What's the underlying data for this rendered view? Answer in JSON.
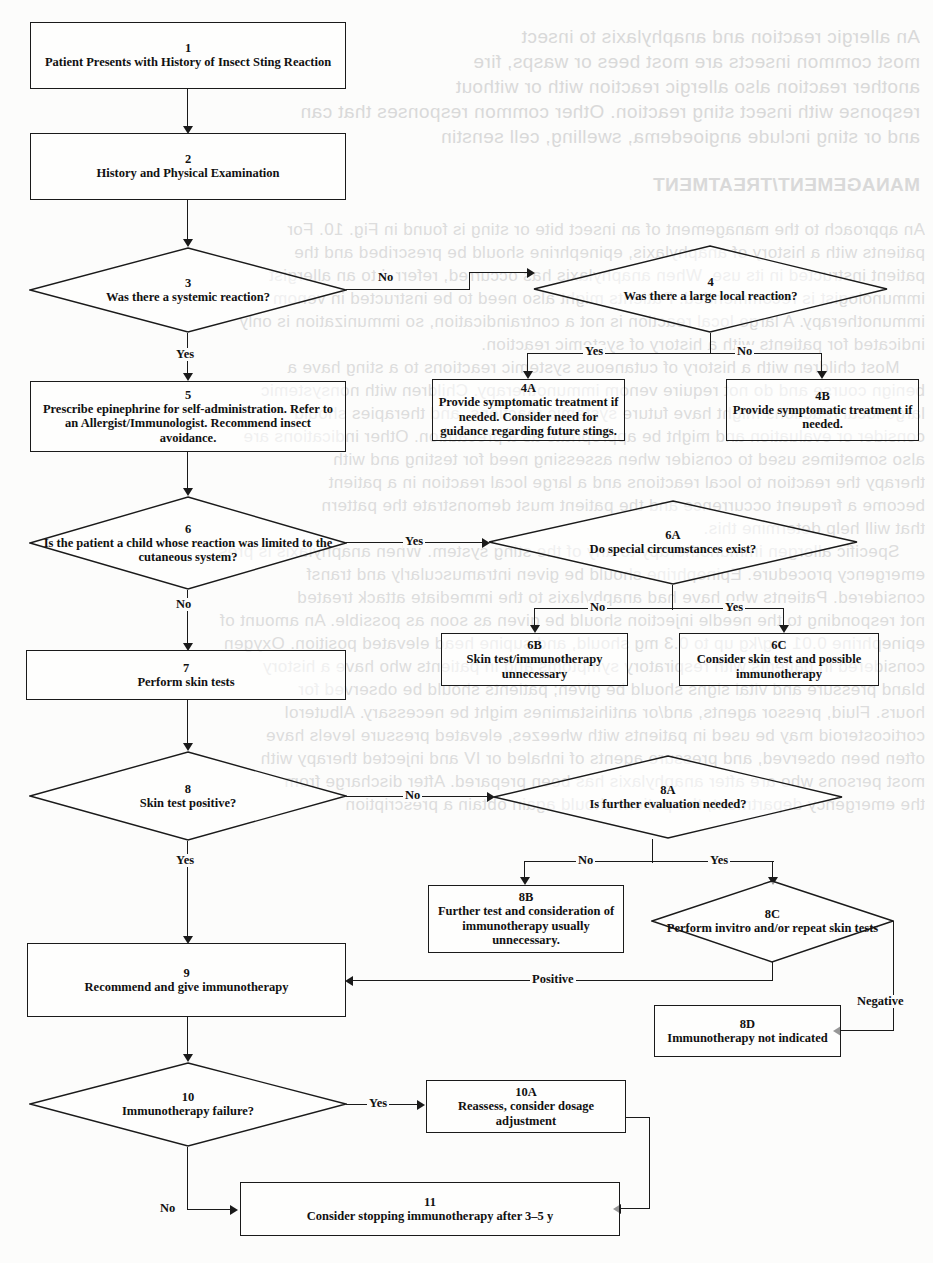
{
  "document": {
    "type": "clinical-algorithm-flowchart",
    "title": "Insect Sting Reaction Management Algorithm"
  },
  "nodes": [
    {
      "id": "n1",
      "number": "1",
      "shape": "box",
      "text": "Patient Presents with History of Insect Sting Reaction"
    },
    {
      "id": "n2",
      "number": "2",
      "shape": "box",
      "text": "History and Physical Examination"
    },
    {
      "id": "n3",
      "number": "3",
      "shape": "diamond",
      "text": "Was there a systemic reaction?"
    },
    {
      "id": "n4",
      "number": "4",
      "shape": "diamond",
      "text": "Was there a large local reaction?"
    },
    {
      "id": "n4a",
      "number": "4A",
      "shape": "box",
      "text": "Provide symptomatic treatment if needed.  Consider need for guidance regarding future stings."
    },
    {
      "id": "n4b",
      "number": "4B",
      "shape": "box",
      "text": "Provide symptomatic treatment if needed."
    },
    {
      "id": "n5",
      "number": "5",
      "shape": "box",
      "text": "Prescribe epinephrine for self-administration.  Refer to an Allergist/Immunologist.  Recommend insect avoidance."
    },
    {
      "id": "n6",
      "number": "6",
      "shape": "diamond",
      "text": "Is the patient a child whose reaction was limited to the cutaneous system?"
    },
    {
      "id": "n6a",
      "number": "6A",
      "shape": "diamond",
      "text": "Do special circumstances exist?"
    },
    {
      "id": "n6b",
      "number": "6B",
      "shape": "box",
      "text": "Skin test/immunotherapy unnecessary"
    },
    {
      "id": "n6c",
      "number": "6C",
      "shape": "box",
      "text": "Consider skin test and possible immunotherapy"
    },
    {
      "id": "n7",
      "number": "7",
      "shape": "box",
      "text": "Perform skin tests"
    },
    {
      "id": "n8",
      "number": "8",
      "shape": "diamond",
      "text": "Skin test positive?"
    },
    {
      "id": "n8a",
      "number": "8A",
      "shape": "diamond",
      "text": "Is further evaluation needed?"
    },
    {
      "id": "n8b",
      "number": "8B",
      "shape": "box",
      "text": "Further test and consideration of immunotherapy usually unnecessary."
    },
    {
      "id": "n8c",
      "number": "8C",
      "shape": "diamond",
      "text": "Perform invitro and/or repeat skin tests"
    },
    {
      "id": "n8d",
      "number": "8D",
      "shape": "box",
      "text": "Immunotherapy not indicated"
    },
    {
      "id": "n9",
      "number": "9",
      "shape": "box",
      "text": "Recommend and give immunotherapy"
    },
    {
      "id": "n10",
      "number": "10",
      "shape": "diamond",
      "text": "Immunotherapy failure?"
    },
    {
      "id": "n10a",
      "number": "10A",
      "shape": "box",
      "text": "Reassess, consider dosage adjustment"
    },
    {
      "id": "n11",
      "number": "11",
      "shape": "box",
      "text": "Consider stopping immunotherapy after 3–5 y"
    }
  ],
  "edge_labels": {
    "e3_no": "No",
    "e3_yes": "Yes",
    "e4_yes": "Yes",
    "e4_no": "No",
    "e6_yes": "Yes",
    "e6_no": "No",
    "e6a_no": "No",
    "e6a_yes": "Yes",
    "e8_no": "No",
    "e8_yes": "Yes",
    "e8a_no": "No",
    "e8a_yes": "Yes",
    "e8c_positive": "Positive",
    "e8c_negative": "Negative",
    "e10_yes": "Yes",
    "e10_no": "No"
  },
  "bleed_text": {
    "block1": "An allergic reaction and anaphylaxis to insect\nmost common insects are most bees or wasps, fire\nanother reaction also allergic reaction with or without\nresponse with insect sting reaction. Other common responses that can\nand or sting include angioedema, swelling, cell senstin",
    "block2": "MANAGEMENT/TREATMENT",
    "block3": "An approach to the management of an insect bite or sting is found in Fig. 10. For\npatients with a history of anaphylaxis, epinephrine should be prescribed and the\npatient instructed in its use. When anaphylaxis has occurred, referral to an allergist\nimmunologist is recommended. Patients might also need to be instructed in venom\nimmunotherapy. A large local reaction is not a contraindication, so immunization is only\nindicated for patients with a history of systemic reaction.\n     Most children with a history of cutaneous systemic reactions to a sting have a\nbenign course and do not require venom immunotherapy. Children with nonsystemic\nlarge local reactions might have future systemic reactions, and therapies should\nconsider or evaluation and might be appropriate as a precaution. Other indications are\nalso sometimes used to consider when assessing need for testing and with\ntherapy the reaction to local reactions and a large local reaction in a patient\nbecome a frequent occurrence and the patient must demonstrate the pattern\nthat will help determine this.\n     Specific allergen immunotherapy to any of the sting system. When anaphylaxis is pres\nemergency procedure. Epinephrine should be given intramuscularly and transf\nconsidered. Patients who have had anaphylaxis to the immediate attack treated\nnot responding to the needle injection should be given as soon as possible. An amount of\nepinephrine 0.01 mg/kg up to 0.3 mg should, and supine head elevated position. Oxygen\nconsidered in patients with respiratory symptoms and in patients who have a history\nbland pressure and vital signs should be given; patients should be observed for\nhours. Fluid, pressor agents, and/or antihistamines might be necessary. Albuterol\ncorticosteroid may be used in patients with wheezes, elevated pressure levels have\noften been observed, and pressure agents of inhaled or IV and injected therapy with\nmost persons who are after anaphylaxis has been prepared. After discharge from\nthe emergency department, the patient should again obtain a prescription"
  }
}
